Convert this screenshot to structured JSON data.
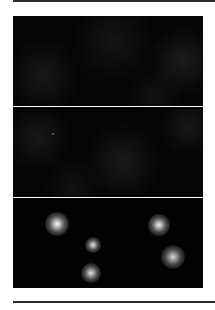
{
  "figure": {
    "panels": [
      {
        "id": "panel-1",
        "description": "dark fluorescence field, faint diffuse background",
        "haze": [
          {
            "x": 30,
            "y": 60,
            "r": 40,
            "alpha": 0.07
          },
          {
            "x": 100,
            "y": 25,
            "r": 45,
            "alpha": 0.06
          },
          {
            "x": 170,
            "y": 45,
            "r": 35,
            "alpha": 0.09
          },
          {
            "x": 140,
            "y": 80,
            "r": 30,
            "alpha": 0.05
          }
        ],
        "spots": []
      },
      {
        "id": "panel-2",
        "description": "dark fluorescence field, faint diffuse background",
        "haze": [
          {
            "x": 25,
            "y": 30,
            "r": 35,
            "alpha": 0.07
          },
          {
            "x": 110,
            "y": 55,
            "r": 40,
            "alpha": 0.08
          },
          {
            "x": 175,
            "y": 20,
            "r": 30,
            "alpha": 0.07
          },
          {
            "x": 60,
            "y": 80,
            "r": 30,
            "alpha": 0.05
          }
        ],
        "spots": [
          {
            "x": 40,
            "y": 27,
            "r": 1.5,
            "intensity": 0.5
          }
        ]
      },
      {
        "id": "panel-3",
        "description": "dark field with five bright fluorescent spots",
        "haze": [],
        "spots": [
          {
            "x": 44,
            "y": 26,
            "r": 12,
            "intensity": 1.0
          },
          {
            "x": 146,
            "y": 27,
            "r": 11,
            "intensity": 0.95
          },
          {
            "x": 80,
            "y": 47,
            "r": 8,
            "intensity": 0.9
          },
          {
            "x": 160,
            "y": 59,
            "r": 12,
            "intensity": 0.85
          },
          {
            "x": 78,
            "y": 75,
            "r": 10,
            "intensity": 0.9
          }
        ]
      }
    ]
  },
  "colors": {
    "background": "#ffffff",
    "panel": "#050505",
    "rule": "#2a2a2a",
    "spot_core": "#f4f4f4"
  }
}
